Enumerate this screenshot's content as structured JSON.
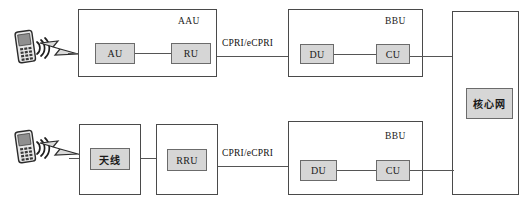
{
  "diagram": {
    "colors": {
      "unit_fill": "#d6d6d6",
      "unit_border": "#6b6b6b",
      "outer_border": "#4a4a4a",
      "line": "#555555",
      "text": "#111111",
      "background": "#ffffff"
    }
  },
  "rows": [
    {
      "id": "aau-row",
      "ue_label": "mobile-phone",
      "container_title": "AAU",
      "units": [
        "AU",
        "RU"
      ],
      "link_label": "CPRI/eCPRI",
      "bbu_title": "BBU",
      "bbu_units": [
        "DU",
        "CU"
      ]
    },
    {
      "id": "rru-row",
      "ue_label": "mobile-phone",
      "antenna_unit": "天线",
      "rru_unit": "RRU",
      "link_label": "CPRI/eCPRI",
      "bbu_title": "BBU",
      "bbu_units": [
        "DU",
        "CU"
      ]
    }
  ],
  "core": {
    "label": "核心网"
  }
}
